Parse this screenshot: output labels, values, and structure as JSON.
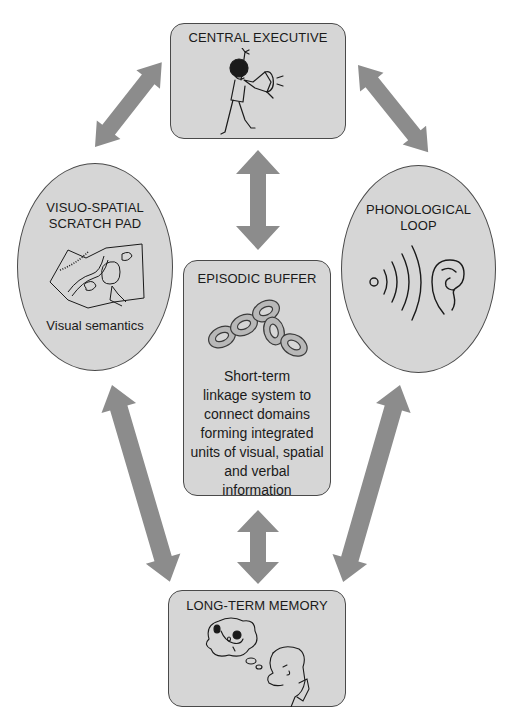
{
  "diagram": {
    "type": "working-memory-model",
    "colors": {
      "background": "#ffffff",
      "node_fill": "#d6d6d6",
      "node_border": "#4a4a4a",
      "arrow": "#8c8c8c",
      "text": "#1a1a1a"
    },
    "nodes": {
      "central_executive": {
        "title": "CENTRAL EXECUTIVE",
        "icon": "person-with-megaphone-icon"
      },
      "visuo_spatial": {
        "title_line1": "VISUO-SPATIAL",
        "title_line2": "SCRATCH PAD",
        "icon": "map-with-hand-icon",
        "caption": "Visual semantics"
      },
      "phonological_loop": {
        "title_line1": "PHONOLOGICAL",
        "title_line2": "LOOP",
        "icon": "sound-waves-ear-icon"
      },
      "episodic_buffer": {
        "title": "EPISODIC BUFFER",
        "icon": "chain-links-icon",
        "description_lines": [
          "Short-term",
          "linkage system to",
          "connect domains",
          "forming integrated",
          "units of visual, spatial",
          "and verbal",
          "information"
        ]
      },
      "long_term_memory": {
        "title": "LONG-TERM MEMORY",
        "icon": "person-thinking-of-dog-icon"
      }
    },
    "connections": [
      {
        "from": "central_executive",
        "to": "visuo_spatial",
        "direction": "bidirectional"
      },
      {
        "from": "central_executive",
        "to": "phonological_loop",
        "direction": "bidirectional"
      },
      {
        "from": "central_executive",
        "to": "episodic_buffer",
        "direction": "bidirectional"
      },
      {
        "from": "visuo_spatial",
        "to": "long_term_memory",
        "direction": "bidirectional"
      },
      {
        "from": "phonological_loop",
        "to": "long_term_memory",
        "direction": "bidirectional"
      },
      {
        "from": "episodic_buffer",
        "to": "long_term_memory",
        "direction": "bidirectional"
      }
    ]
  }
}
